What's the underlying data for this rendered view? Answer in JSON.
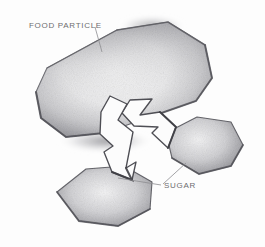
{
  "figure": {
    "medium": "pencil-sketch",
    "background_color": "#fdfdfd",
    "graphite_color": "#58585c",
    "label_color": "#6d6d70",
    "leader_line_color": "#8d8d90"
  },
  "labels": {
    "food_particle": "FOOD PARTICLE",
    "sugar": "SUGAR"
  },
  "shapes": {
    "food_particle": {
      "name": "food-particle",
      "kind": "large irregular polygon",
      "points": "36,92 47,68 117,30 168,22 205,45 212,78 196,101 150,117 104,133 66,137 41,118"
    },
    "sugar_crystal_right": {
      "name": "sugar-crystal-right",
      "kind": "hexagonal crystal",
      "points": "166,133 197,117 231,122 243,145 231,166 199,174 172,158"
    },
    "sugar_crystal_lower": {
      "name": "sugar-crystal-lower",
      "kind": "hexagonal crystal",
      "points": "57,192 86,169 124,166 152,182 150,209 118,226 79,221"
    },
    "arrow_right": {
      "name": "arrow-right",
      "kind": "white ribbon arrow",
      "points": "130,100 152,99 140,115 160,112 176,127 168,148 152,133 158,127 134,126 122,113"
    },
    "arrow_down_left": {
      "name": "arrow-down-left",
      "kind": "white ribbon arrow",
      "points": "110,96 127,104 118,120 133,132 126,168 136,162 132,180 112,172 104,152 113,146 100,134 101,112"
    }
  },
  "leaders": {
    "food_particle": {
      "x1": 95,
      "y1": 27,
      "x2": 102,
      "y2": 52
    },
    "sugar_right": {
      "x1": 186,
      "y1": 163,
      "x2": 163,
      "y2": 184
    },
    "sugar_lower": {
      "x1": 161,
      "y1": 185,
      "x2": 118,
      "y2": 178
    }
  }
}
